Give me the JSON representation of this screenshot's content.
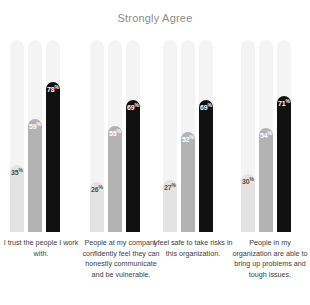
{
  "chart_data": {
    "type": "bar",
    "title": "Strongly Agree",
    "xlabel": "",
    "ylabel": "",
    "ylim": [
      0,
      100
    ],
    "grid": false,
    "legend": "none",
    "value_suffix": "%",
    "categories": [
      "I trust the people I work with.",
      "People at my company confidently feel they can honestly communicate and be vulnerable.",
      "I feel safe to take risks in this organization.",
      "People in my organization are able to bring up problems and tough issues."
    ],
    "series": [
      {
        "name": "series-1",
        "color": "#e3e3e3",
        "label_color": "#4d4d4d",
        "values": [
          35,
          26,
          27,
          30
        ]
      },
      {
        "name": "series-2",
        "color": "#b3b3b3",
        "label_color": "#ffffff",
        "values": [
          59,
          55,
          52,
          54
        ]
      },
      {
        "name": "series-3",
        "color": "#111111",
        "label_color": "#ffffff",
        "values": [
          78,
          69,
          69,
          71
        ]
      }
    ],
    "track_color": "#f4f4f4"
  },
  "groups": [
    {
      "label": "I trust the people I work with.",
      "label_lines": [
        "I trust the people",
        "I work with."
      ],
      "bars": [
        {
          "value": "35",
          "suffix": "%",
          "percent": 35,
          "color": "#e3e3e3",
          "tone": "dark"
        },
        {
          "value": "59",
          "suffix": "%",
          "percent": 59,
          "color": "#b3b3b3",
          "tone": "light"
        },
        {
          "value": "78",
          "suffix": "%",
          "percent": 78,
          "color": "#111111",
          "tone": "light"
        }
      ]
    },
    {
      "label": "People at my company confidently feel they can honestly communicate and be vulnerable.",
      "label_lines": [
        "People at my company",
        "confidently feel they",
        "can honestly",
        "communicate and be",
        "vulnerable."
      ],
      "bars": [
        {
          "value": "26",
          "suffix": "%",
          "percent": 26,
          "color": "#e3e3e3",
          "tone": "dark"
        },
        {
          "value": "55",
          "suffix": "%",
          "percent": 55,
          "color": "#b3b3b3",
          "tone": "light"
        },
        {
          "value": "69",
          "suffix": "%",
          "percent": 69,
          "color": "#111111",
          "tone": "light"
        }
      ]
    },
    {
      "label": "I feel safe to take risks in this organization.",
      "label_lines": [
        "I feel safe to take risks",
        "in this organization."
      ],
      "bars": [
        {
          "value": "27",
          "suffix": "%",
          "percent": 27,
          "color": "#e3e3e3",
          "tone": "dark"
        },
        {
          "value": "52",
          "suffix": "%",
          "percent": 52,
          "color": "#b3b3b3",
          "tone": "light"
        },
        {
          "value": "69",
          "suffix": "%",
          "percent": 69,
          "color": "#111111",
          "tone": "light"
        }
      ]
    },
    {
      "label": "People in my organization are able to bring up problems and tough issues.",
      "label_lines": [
        "People in my",
        "organization are able",
        "to bring up problems",
        "and tough issues."
      ],
      "bars": [
        {
          "value": "30",
          "suffix": "%",
          "percent": 30,
          "color": "#e3e3e3",
          "tone": "dark"
        },
        {
          "value": "54",
          "suffix": "%",
          "percent": 54,
          "color": "#b3b3b3",
          "tone": "light"
        },
        {
          "value": "71",
          "suffix": "%",
          "percent": 71,
          "color": "#111111",
          "tone": "light"
        }
      ]
    }
  ]
}
